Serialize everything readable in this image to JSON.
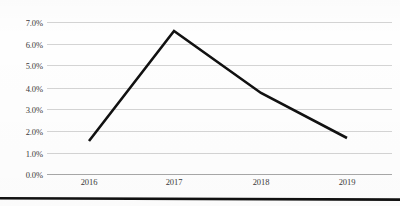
{
  "chart_data": {
    "type": "line",
    "title": "",
    "subtitle": "",
    "xlabel": "",
    "ylabel": "",
    "categories": [
      "2016",
      "2017",
      "2018",
      "2019"
    ],
    "values": [
      0.016,
      0.065,
      0.038,
      0.0175
    ],
    "value_labels": [
      "1.6%",
      "6.5%",
      "3.8%",
      "1.8%"
    ],
    "series": [
      {
        "name": "",
        "values": [
          0.016,
          0.065,
          0.038,
          0.0175
        ]
      }
    ],
    "ylim": [
      0.0,
      0.07
    ],
    "ytick_values": [
      0.0,
      0.01,
      0.02,
      0.03,
      0.04,
      0.05,
      0.06,
      0.07
    ],
    "ytick_labels": [
      "0.0%",
      "1.0%",
      "2.0%",
      "3.0%",
      "4.0%",
      "5.0%",
      "6.0%",
      "7.0%"
    ],
    "xtick_labels": [
      "2016",
      "2017",
      "2018",
      "2019"
    ],
    "grid": "horizontal",
    "legend": "none",
    "markers": "none",
    "line_color": "#111111",
    "line_width_px": 2.6,
    "gridline_color": "#d4d4d4",
    "baseline_color": "#a8a8a8",
    "tick_text_color": "#3a3a3a",
    "background_color": "#fefefe",
    "annotations": []
  },
  "axes": {
    "y": {
      "ticks": [
        {
          "label": "7.0%",
          "top_px": 18
        },
        {
          "label": "6.0%",
          "top_px": 40
        },
        {
          "label": "5.0%",
          "top_px": 61
        },
        {
          "label": "4.0%",
          "top_px": 84
        },
        {
          "label": "3.0%",
          "top_px": 105
        },
        {
          "label": "2.0%",
          "top_px": 127
        },
        {
          "label": "1.0%",
          "top_px": 149
        },
        {
          "label": "0.0%",
          "top_px": 170
        }
      ],
      "gridlines": [
        {
          "top_px": 22
        },
        {
          "top_px": 44
        },
        {
          "top_px": 65
        },
        {
          "top_px": 88
        },
        {
          "top_px": 109
        },
        {
          "top_px": 131
        },
        {
          "top_px": 153
        },
        {
          "top_px": 174
        }
      ]
    },
    "x": {
      "ticks": [
        {
          "label": "2016",
          "left_px": 67
        },
        {
          "label": "2017",
          "left_px": 152
        },
        {
          "label": "2018",
          "left_px": 239
        },
        {
          "label": "2019",
          "left_px": 325
        }
      ]
    }
  },
  "series_path": {
    "points": [
      {
        "x_px": 89,
        "y_px": 141
      },
      {
        "x_px": 174,
        "y_px": 31
      },
      {
        "x_px": 261,
        "y_px": 93
      },
      {
        "x_px": 347,
        "y_px": 138
      }
    ]
  },
  "bottom_rule": {
    "color": "#111111"
  }
}
